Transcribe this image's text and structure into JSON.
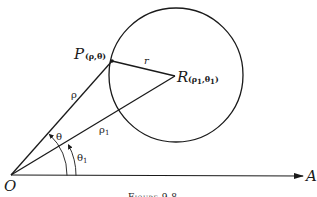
{
  "figure": {
    "caption": "Figure 9.8",
    "colors": {
      "ink": "#1a1a1a",
      "background": "#ffffff"
    },
    "points": {
      "origin": {
        "label": "O",
        "x": 11,
        "y": 175
      },
      "P": {
        "label": "P",
        "coords": "(ρ,θ)",
        "x": 112,
        "y": 61
      },
      "R": {
        "label": "R",
        "coords_main": "(ρ",
        "coords_sub1": "1",
        "coords_mid": ",θ",
        "coords_sub2": "1",
        "coords_end": ")",
        "x": 175,
        "y": 76
      },
      "axis_end": {
        "label": "A",
        "x": 303,
        "y": 176
      }
    },
    "circle": {
      "cx": 176,
      "cy": 75,
      "r": 67
    },
    "labels": {
      "rho": "ρ",
      "rho1_main": "ρ",
      "rho1_sub": "1",
      "r": "r",
      "theta": "θ",
      "theta1_main": "θ",
      "theta1_sub": "1"
    }
  }
}
